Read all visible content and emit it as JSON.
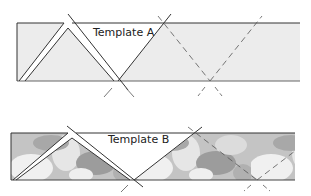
{
  "diagram": {
    "templates": [
      {
        "id": "A",
        "label": "Template A",
        "fill": "solid-light-gray",
        "fill_color": "#ececec",
        "stroke_color": "#333333"
      },
      {
        "id": "B",
        "label": "Template B",
        "fill": "floral-photo-texture",
        "fill_color": "#b8b8b8",
        "stroke_color": "#333333"
      }
    ],
    "legend": {
      "solid_line": "cut line",
      "dashed_line": "repeat placement guide"
    }
  }
}
